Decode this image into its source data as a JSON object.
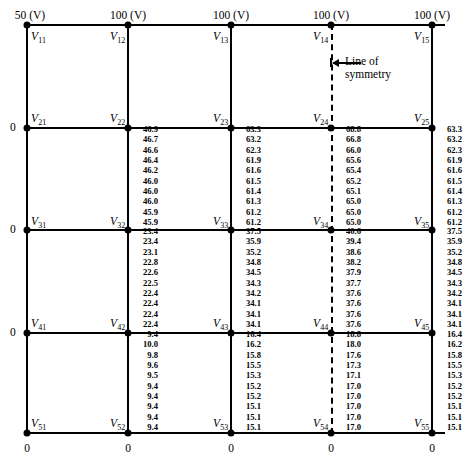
{
  "figure": {
    "type": "finite-difference-grid"
  },
  "top_boundary_labels": [
    "50 (V)",
    "100 (V)",
    "100 (V)",
    "100 (V)",
    "100 (V)"
  ],
  "left_boundary_labels": [
    "0",
    "0",
    "0"
  ],
  "bottom_boundary_labels": [
    "0",
    "0",
    "0",
    "0",
    "0"
  ],
  "symmetry": {
    "label_line1": "Line of",
    "label_line2": "symmetry"
  },
  "nodes": [
    {
      "name": "V11",
      "base": "V",
      "sub": "11"
    },
    {
      "name": "V12",
      "base": "V",
      "sub": "12"
    },
    {
      "name": "V13",
      "base": "V",
      "sub": "13"
    },
    {
      "name": "V14",
      "base": "V",
      "sub": "14"
    },
    {
      "name": "V15",
      "base": "V",
      "sub": "15"
    },
    {
      "name": "V21",
      "base": "V",
      "sub": "21"
    },
    {
      "name": "V22",
      "base": "V",
      "sub": "22"
    },
    {
      "name": "V23",
      "base": "V",
      "sub": "23"
    },
    {
      "name": "V24",
      "base": "V",
      "sub": "24"
    },
    {
      "name": "V25",
      "base": "V",
      "sub": "25"
    },
    {
      "name": "V31",
      "base": "V",
      "sub": "31"
    },
    {
      "name": "V32",
      "base": "V",
      "sub": "32"
    },
    {
      "name": "V33",
      "base": "V",
      "sub": "33"
    },
    {
      "name": "V34",
      "base": "V",
      "sub": "34"
    },
    {
      "name": "V35",
      "base": "V",
      "sub": "35"
    },
    {
      "name": "V41",
      "base": "V",
      "sub": "41"
    },
    {
      "name": "V42",
      "base": "V",
      "sub": "42"
    },
    {
      "name": "V43",
      "base": "V",
      "sub": "43"
    },
    {
      "name": "V44",
      "base": "V",
      "sub": "44"
    },
    {
      "name": "V45",
      "base": "V",
      "sub": "45"
    },
    {
      "name": "V51",
      "base": "V",
      "sub": "51"
    },
    {
      "name": "V52",
      "base": "V",
      "sub": "52"
    },
    {
      "name": "V53",
      "base": "V",
      "sub": "53"
    },
    {
      "name": "V54",
      "base": "V",
      "sub": "54"
    },
    {
      "name": "V55",
      "base": "V",
      "sub": "55"
    }
  ],
  "chart_data": {
    "type": "table",
    "iterations": 10,
    "columns": [
      "V22",
      "V23",
      "V24",
      "V25",
      "V32",
      "V33",
      "V34",
      "V35",
      "V42",
      "V43",
      "V44",
      "V45"
    ],
    "series": [
      {
        "name": "V22",
        "values": [
          "46.9",
          "46.7",
          "46.6",
          "46.4",
          "46.2",
          "46.0",
          "46.0",
          "46.0",
          "45.9",
          "45.9"
        ]
      },
      {
        "name": "V23",
        "values": [
          "63.3",
          "63.2",
          "62.3",
          "61.9",
          "61.6",
          "61.5",
          "61.4",
          "61.3",
          "61.2",
          "61.2"
        ]
      },
      {
        "name": "V24",
        "values": [
          "68.8",
          "66.8",
          "66.0",
          "65.6",
          "65.4",
          "65.2",
          "65.1",
          "65.0",
          "65.0",
          "65.0"
        ]
      },
      {
        "name": "V25",
        "values": [
          "63.3",
          "63.2",
          "62.3",
          "61.9",
          "61.6",
          "61.5",
          "61.4",
          "61.3",
          "61.2",
          "61.2"
        ]
      },
      {
        "name": "V32",
        "values": [
          "23.4",
          "23.4",
          "23.1",
          "22.8",
          "22.6",
          "22.5",
          "22.4",
          "22.4",
          "22.4",
          "22.4"
        ]
      },
      {
        "name": "V33",
        "values": [
          "37.5",
          "35.9",
          "35.2",
          "34.8",
          "34.5",
          "34.3",
          "34.2",
          "34.1",
          "34.1",
          "34.1"
        ]
      },
      {
        "name": "V34",
        "values": [
          "40.6",
          "39.4",
          "38.6",
          "38.2",
          "37.9",
          "37.7",
          "37.6",
          "37.6",
          "37.6",
          "37.6"
        ]
      },
      {
        "name": "V35",
        "values": [
          "37.5",
          "35.9",
          "35.2",
          "34.8",
          "34.5",
          "34.3",
          "34.2",
          "34.1",
          "34.1",
          "34.1"
        ]
      },
      {
        "name": "V42",
        "values": [
          "9.4",
          "10.0",
          "9.8",
          "9.6",
          "9.5",
          "9.4",
          "9.4",
          "9.4",
          "9.4",
          "9.4"
        ]
      },
      {
        "name": "V43",
        "values": [
          "16.4",
          "16.2",
          "15.8",
          "15.5",
          "15.3",
          "15.2",
          "15.2",
          "15.1",
          "15.1",
          "15.1"
        ]
      },
      {
        "name": "V44",
        "values": [
          "18.8",
          "18.0",
          "17.6",
          "17.3",
          "17.1",
          "17.0",
          "17.0",
          "17.0",
          "17.0",
          "17.0"
        ]
      },
      {
        "name": "V45",
        "values": [
          "16.4",
          "16.2",
          "15.8",
          "15.5",
          "15.3",
          "15.2",
          "15.2",
          "15.1",
          "15.1",
          "15.1"
        ]
      }
    ],
    "boundary_conditions": {
      "top_left_corner": "50 (V)",
      "top": "100 (V)",
      "left": "0",
      "bottom": "0"
    }
  }
}
